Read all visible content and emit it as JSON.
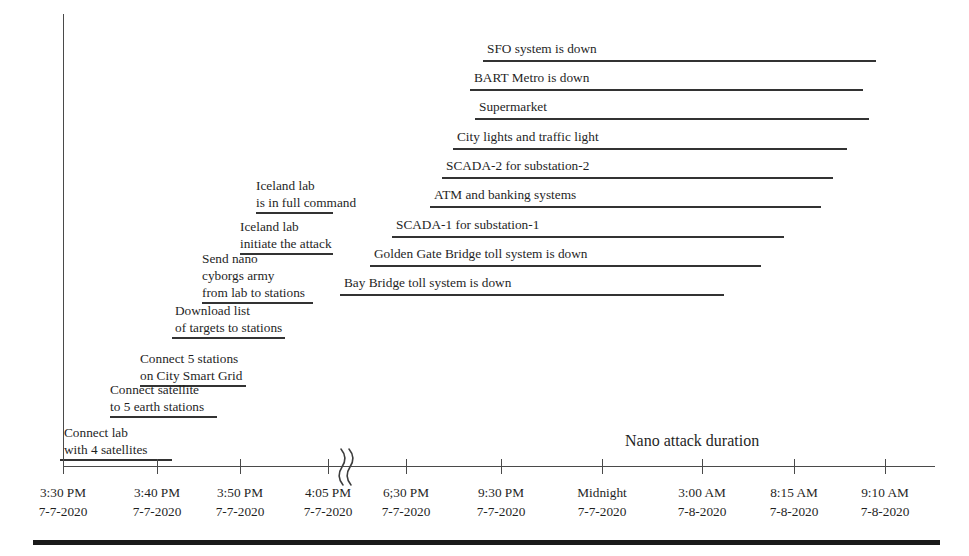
{
  "chart_data": {
    "type": "bar",
    "title": "",
    "orientation": "horizontal",
    "ylabel": "Attack activities",
    "xlabel": "",
    "grid": false,
    "legend": "none",
    "annotation": "Nano attack duration",
    "axis_break_after": "4:05 PM 7-7-2020",
    "x_tick_labels": [
      {
        "time": "3:30 PM",
        "date": "7-7-2020",
        "px": 63
      },
      {
        "time": "3:40 PM",
        "date": "7-7-2020",
        "px": 157
      },
      {
        "time": "3:50 PM",
        "date": "7-7-2020",
        "px": 240
      },
      {
        "time": "4:05 PM",
        "date": "7-7-2020",
        "px": 328
      },
      {
        "time": "6;30 PM",
        "date": "7-7-2020",
        "px": 406
      },
      {
        "time": "9:30 PM",
        "date": "7-7-2020",
        "px": 501
      },
      {
        "time": "Midnight",
        "date": "7-7-2020",
        "px": 602
      },
      {
        "time": "3:00 AM",
        "date": "7-8-2020",
        "px": 702
      },
      {
        "time": "8:15 AM",
        "date": "7-8-2020",
        "px": 794
      },
      {
        "time": "9:10 AM",
        "date": "7-8-2020",
        "px": 885
      }
    ],
    "categories": [
      "SFO system is down",
      "BART Metro is down",
      "Supermarket",
      "City lights and traffic light",
      "SCADA-2 for substation-2",
      "ATM and banking systems",
      "SCADA-1 for substation-1",
      "Golden Gate Bridge toll system is down",
      "Bay Bridge toll system is down",
      "Iceland lab is in full command",
      "Iceland lab initiate the attack",
      "Send nano cyborgs army from lab to stations",
      "Download list of targets to stations",
      "Connect 5 stations on City Smart Grid",
      "Connect satellite to 5 earth stations",
      "Connect lab with 4 satellites"
    ],
    "activities": [
      {
        "id": "sfo-system-is-down",
        "lines": [
          "SFO system is down"
        ],
        "bar_start_px": 483,
        "bar_end_px": 876,
        "bar_y_px": 60,
        "label_x_px": 487,
        "label_y_px": 41
      },
      {
        "id": "bart-metro-is-down",
        "lines": [
          "BART Metro is down"
        ],
        "bar_start_px": 470,
        "bar_end_px": 863,
        "bar_y_px": 89,
        "label_x_px": 474,
        "label_y_px": 70
      },
      {
        "id": "supermarket",
        "lines": [
          "Supermarket"
        ],
        "bar_start_px": 475,
        "bar_end_px": 869,
        "bar_y_px": 118,
        "label_x_px": 479,
        "label_y_px": 99
      },
      {
        "id": "city-lights-and-traffic-light",
        "lines": [
          "City lights and traffic light"
        ],
        "bar_start_px": 453,
        "bar_end_px": 847,
        "bar_y_px": 148,
        "label_x_px": 457,
        "label_y_px": 129
      },
      {
        "id": "scada-2-for-substation-2",
        "lines": [
          "SCADA-2 for substation-2"
        ],
        "bar_start_px": 442,
        "bar_end_px": 833,
        "bar_y_px": 177,
        "label_x_px": 446,
        "label_y_px": 158
      },
      {
        "id": "atm-and-banking-systems",
        "lines": [
          "ATM and banking systems"
        ],
        "bar_start_px": 430,
        "bar_end_px": 821,
        "bar_y_px": 206,
        "label_x_px": 434,
        "label_y_px": 187
      },
      {
        "id": "scada-1-for-substation-1",
        "lines": [
          "SCADA-1 for substation-1"
        ],
        "bar_start_px": 392,
        "bar_end_px": 784,
        "bar_y_px": 236,
        "label_x_px": 396,
        "label_y_px": 217
      },
      {
        "id": "golden-gate-bridge-toll-system-is-down",
        "lines": [
          "Golden Gate Bridge toll system is down"
        ],
        "bar_start_px": 370,
        "bar_end_px": 761,
        "bar_y_px": 265,
        "label_x_px": 374,
        "label_y_px": 246
      },
      {
        "id": "bay-bridge-toll-system-is-down",
        "lines": [
          "Bay Bridge toll system is down"
        ],
        "bar_start_px": 340,
        "bar_end_px": 724,
        "bar_y_px": 294,
        "label_x_px": 344,
        "label_y_px": 275
      },
      {
        "id": "iceland-lab-is-in-full-command",
        "lines": [
          "Iceland lab",
          "is in full command"
        ],
        "bar_start_px": 256,
        "bar_end_px": 333,
        "bar_y_px": 212,
        "label_x_px": 256,
        "label_y_px": 177
      },
      {
        "id": "iceland-lab-initiate-the-attack",
        "lines": [
          "Iceland lab",
          "initiate the attack"
        ],
        "bar_start_px": 240,
        "bar_end_px": 333,
        "bar_y_px": 253,
        "label_x_px": 240,
        "label_y_px": 218
      },
      {
        "id": "send-nano-cyborgs-army-from-lab-to-stations",
        "lines": [
          "Send nano",
          "cyborgs army",
          "from lab to stations"
        ],
        "bar_start_px": 202,
        "bar_end_px": 313,
        "bar_y_px": 302,
        "label_x_px": 202,
        "label_y_px": 250
      },
      {
        "id": "download-list-of-targets-to-stations",
        "lines": [
          "Download list",
          "of targets to stations"
        ],
        "bar_start_px": 172,
        "bar_end_px": 285,
        "bar_y_px": 337,
        "label_x_px": 175,
        "label_y_px": 302
      },
      {
        "id": "connect-5-stations-on-city-smart-grid",
        "lines": [
          "Connect 5 stations",
          "on City Smart Grid"
        ],
        "bar_start_px": 140,
        "bar_end_px": 246,
        "bar_y_px": 385,
        "label_x_px": 140,
        "label_y_px": 350
      },
      {
        "id": "connect-satellite-to-5-earth-stations",
        "lines": [
          "Connect satellite",
          "to 5 earth stations"
        ],
        "bar_start_px": 110,
        "bar_end_px": 217,
        "bar_y_px": 416,
        "label_x_px": 110,
        "label_y_px": 381
      },
      {
        "id": "connect-lab-with-4-satellites",
        "lines": [
          "Connect lab",
          "with 4 satellites"
        ],
        "bar_start_px": 60,
        "bar_end_px": 172,
        "bar_y_px": 459,
        "label_x_px": 64,
        "label_y_px": 424
      }
    ]
  },
  "colors": {
    "bar": "#333333",
    "axis": "#4a4a4a",
    "text": "#1f1f1f",
    "rule": "#1a1a1a",
    "background": "#ffffff"
  }
}
